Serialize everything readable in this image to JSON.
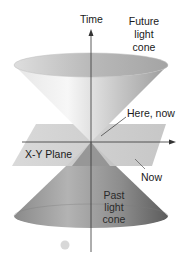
{
  "diagram": {
    "labels": {
      "time_axis": "Time",
      "future_cone": [
        "Future",
        "light",
        "cone"
      ],
      "here_now": "Here, now",
      "plane": "X-Y Plane",
      "now": "Now",
      "past_cone": [
        "Past",
        "light",
        "cone"
      ]
    },
    "colors": {
      "future_cone_light": "#f2f2f2",
      "future_cone_mid": "#c9c9c9",
      "future_cone_dark": "#9a9a9a",
      "past_cone_light": "#a8a8a8",
      "past_cone_dark": "#5a5a5a",
      "plane": "#cfcfcf",
      "axis": "#333333"
    }
  }
}
